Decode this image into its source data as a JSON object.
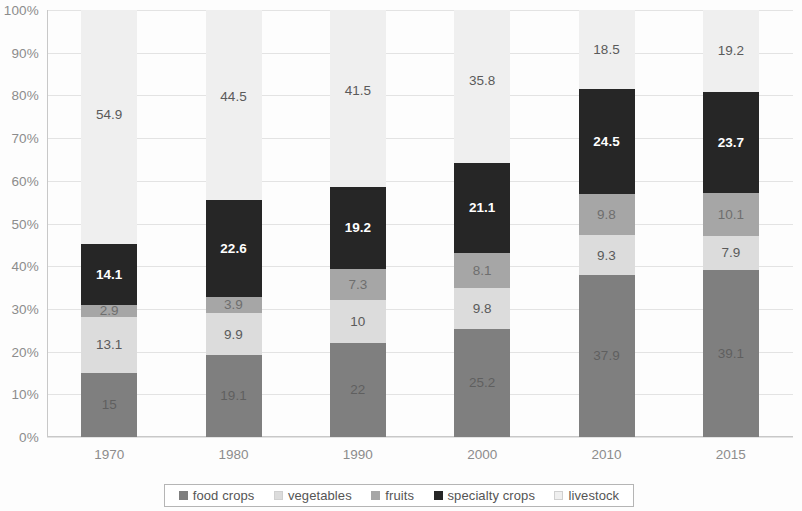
{
  "chart_data": {
    "type": "bar",
    "stacked": true,
    "normalized_percent": true,
    "title": "",
    "subtitle": "",
    "xlabel": "",
    "ylabel": "",
    "grid": true,
    "legend_position": "bottom",
    "ylim": [
      0,
      100
    ],
    "y_tick_labels": [
      "100%",
      "90%",
      "80%",
      "70%",
      "60%",
      "50%",
      "40%",
      "30%",
      "20%",
      "10%",
      "0%"
    ],
    "y_tick_values": [
      100,
      90,
      80,
      70,
      60,
      50,
      40,
      30,
      20,
      10,
      0
    ],
    "categories": [
      "1970",
      "1980",
      "1990",
      "2000",
      "2010",
      "2015"
    ],
    "series": [
      {
        "name": "food crops",
        "color": "#7f7f7f",
        "label_color": "#5f5f5f",
        "values": [
          15.0,
          19.1,
          22.0,
          25.2,
          37.9,
          39.1
        ],
        "labels": [
          "15",
          "19.1",
          "22",
          "25.2",
          "37.9",
          "39.1"
        ]
      },
      {
        "name": "vegetables",
        "color": "#dcdcdc",
        "label_color": "#5a5a5a",
        "values": [
          13.1,
          9.9,
          10.0,
          9.8,
          9.3,
          7.9
        ],
        "labels": [
          "13.1",
          "9.9",
          "10",
          "9.8",
          "9.3",
          "7.9"
        ]
      },
      {
        "name": "fruits",
        "color": "#a6a6a6",
        "label_color": "#6e6e6e",
        "values": [
          2.9,
          3.9,
          7.3,
          8.1,
          9.8,
          10.1
        ],
        "labels": [
          "2.9",
          "3.9",
          "7.3",
          "8.1",
          "9.8",
          "10.1"
        ]
      },
      {
        "name": "specialty crops",
        "color": "#262626",
        "label_color": "#ffffff",
        "values": [
          14.1,
          22.6,
          19.2,
          21.1,
          24.5,
          23.7
        ],
        "labels": [
          "14.1",
          "22.6",
          "19.2",
          "21.1",
          "24.5",
          "23.7"
        ]
      },
      {
        "name": "livestock",
        "color": "#efefef",
        "label_color": "#5a5a5a",
        "values": [
          54.9,
          44.5,
          41.5,
          35.8,
          18.5,
          19.2
        ],
        "labels": [
          "54.9",
          "44.5",
          "41.5",
          "35.8",
          "18.5",
          "19.2"
        ]
      }
    ]
  },
  "legend": {
    "items": [
      {
        "label": "food crops",
        "color": "#7f7f7f"
      },
      {
        "label": "vegetables",
        "color": "#dcdcdc"
      },
      {
        "label": "fruits",
        "color": "#a6a6a6"
      },
      {
        "label": "specialty crops",
        "color": "#262626"
      },
      {
        "label": "livestock",
        "color": "#efefef"
      }
    ]
  }
}
